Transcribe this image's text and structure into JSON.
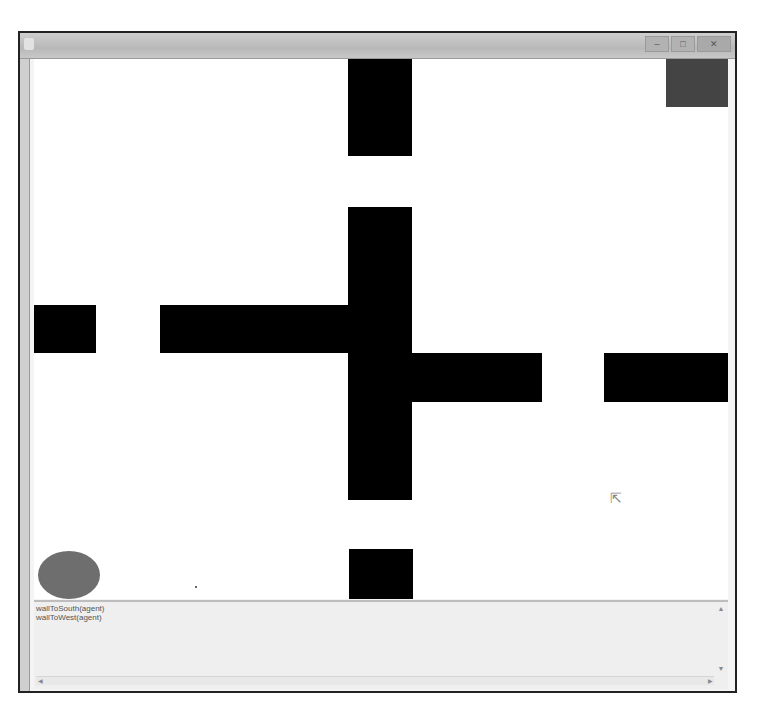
{
  "window": {
    "title": "",
    "controls": [
      {
        "name": "minimize",
        "glyph": "–"
      },
      {
        "name": "maximize",
        "glyph": "□"
      },
      {
        "name": "close",
        "glyph": "✕"
      }
    ]
  },
  "world": {
    "background": "#ffffff",
    "wall_color": "#000000",
    "walls": [
      {
        "id": "top-vertical",
        "x": 314,
        "y": 0,
        "w": 64,
        "h": 97
      },
      {
        "id": "center-vertical",
        "x": 314,
        "y": 148,
        "w": 64,
        "h": 293
      },
      {
        "id": "left-stub",
        "x": 0,
        "y": 246,
        "w": 62,
        "h": 48
      },
      {
        "id": "left-arm",
        "x": 126,
        "y": 246,
        "w": 252,
        "h": 48
      },
      {
        "id": "right-arm",
        "x": 314,
        "y": 294,
        "w": 194,
        "h": 49
      },
      {
        "id": "right-stub",
        "x": 570,
        "y": 294,
        "w": 124,
        "h": 49
      },
      {
        "id": "bottom-block",
        "x": 315,
        "y": 490,
        "w": 64,
        "h": 50
      }
    ],
    "goal": {
      "x": 632,
      "y": 0,
      "w": 62,
      "h": 48,
      "color": "#444444"
    },
    "agent": {
      "x": 4,
      "y": 492,
      "w": 62,
      "h": 48,
      "color": "#6e6e6e"
    },
    "marker_dot": {
      "x": 161,
      "y": 527
    },
    "cursor": {
      "x": 576,
      "y": 432,
      "glyph": "⇱"
    }
  },
  "console": {
    "lines": [
      "wallToSouth(agent)",
      "wallToWest(agent)"
    ],
    "scroll_up": "▲",
    "scroll_down": "▼",
    "scroll_left": "◀",
    "scroll_right": "▶"
  }
}
